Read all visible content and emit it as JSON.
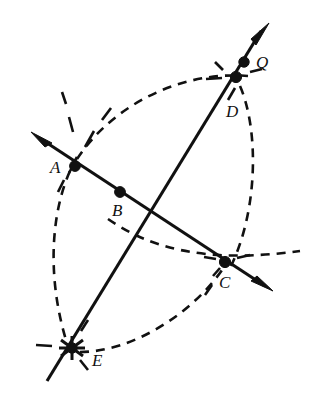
{
  "figure": {
    "width": 314,
    "height": 399,
    "background_color": "#ffffff",
    "ink_color": "#111111"
  },
  "labels": {
    "a": "A",
    "b": "B",
    "c": "C",
    "d": "D",
    "e": "E",
    "q": "Q"
  },
  "points": [
    {
      "name": "A",
      "label": "A",
      "x": 75,
      "y": 166,
      "marker": "filled-dot",
      "label_x": 50,
      "label_y": 159
    },
    {
      "name": "B",
      "label": "B",
      "x": 120,
      "y": 192,
      "marker": "filled-dot",
      "label_x": 112,
      "label_y": 202
    },
    {
      "name": "C",
      "label": "C",
      "x": 225,
      "y": 262,
      "marker": "filled-dot",
      "label_x": 219,
      "label_y": 274
    },
    {
      "name": "D",
      "label": "D",
      "x": 236,
      "y": 77,
      "marker": "filled-dot",
      "label_x": 226,
      "label_y": 103
    },
    {
      "name": "E",
      "label": "E",
      "x": 72,
      "y": 348,
      "marker": "star",
      "label_x": 92,
      "label_y": 352
    },
    {
      "name": "Q",
      "label": "Q",
      "x": 244,
      "y": 62,
      "marker": "filled-dot",
      "label_x": 256,
      "label_y": 54
    }
  ],
  "lines": [
    {
      "name": "line-ABC",
      "description": "double-headed ray through A, B and C",
      "from_x": 32,
      "from_y": 133,
      "to_x": 272,
      "to_y": 290,
      "arrow_start": true,
      "arrow_end": true,
      "style": "solid"
    },
    {
      "name": "line-EDQ",
      "description": "double-headed ray through E, D and Q",
      "from_x": 268,
      "from_y": 24,
      "to_x": 47,
      "to_y": 381,
      "arrow_start": true,
      "arrow_end": false,
      "style": "solid"
    }
  ],
  "arcs": [
    {
      "name": "arc-A-to-E",
      "description": "left compass arc from A down to E",
      "style": "dashed"
    },
    {
      "name": "arc-A-to-D",
      "description": "upper compass arc from A up to D",
      "style": "dashed"
    },
    {
      "name": "arc-D-to-C",
      "description": "right compass arc from D down to C",
      "style": "dashed"
    },
    {
      "name": "arc-E-to-C",
      "description": "lower compass arc from E up to C",
      "style": "dashed"
    },
    {
      "name": "arc-B-to-C-right",
      "description": "long arc crossing near B through C to right edge",
      "style": "dashed"
    }
  ],
  "notes": {
    "construction_type": "compass-and-straightedge",
    "marker_count": 6,
    "line_count": 2,
    "arc_count": 5
  }
}
